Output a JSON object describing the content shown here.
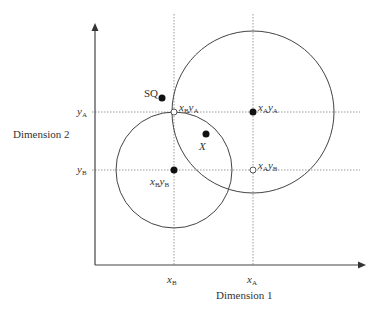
{
  "diagram": {
    "axes": {
      "x_label": "Dimension 1",
      "y_label": "Dimension 2",
      "x_ticks": [
        {
          "var": "x",
          "sub": "B"
        },
        {
          "var": "x",
          "sub": "A"
        }
      ],
      "y_ticks": [
        {
          "var": "y",
          "sub": "A"
        },
        {
          "var": "y",
          "sub": "B"
        }
      ]
    },
    "points": {
      "sq": {
        "label": "SQ",
        "filled": true
      },
      "x": {
        "label": "X",
        "filled": true
      },
      "xAyA": {
        "var1": "x",
        "sub1": "A",
        "var2": "y",
        "sub2": "A",
        "filled": true
      },
      "xByB": {
        "var1": "x",
        "sub1": "B",
        "var2": "y",
        "sub2": "B",
        "filled": true
      },
      "xByA": {
        "var1": "x",
        "sub1": "B",
        "var2": "y",
        "sub2": "A",
        "filled": false
      },
      "xAyB": {
        "var1": "x",
        "sub1": "A",
        "var2": "y",
        "sub2": "B",
        "filled": false
      }
    },
    "circles": [
      {
        "name": "indifference-circle-A",
        "center": "xAyA"
      },
      {
        "name": "indifference-circle-B",
        "center": "xByB"
      }
    ],
    "colors": {
      "line": "#444444",
      "dotted": "#9a9a9a",
      "point": "#111111"
    }
  }
}
